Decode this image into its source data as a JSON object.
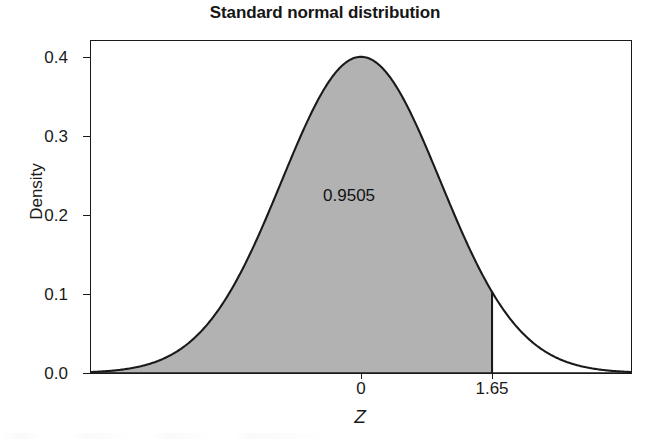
{
  "chart_data": {
    "type": "area",
    "title": "Standard normal distribution",
    "xlabel": "Z",
    "ylabel": "Density",
    "xlim": [
      -3.4,
      3.4
    ],
    "ylim": [
      0.0,
      0.42
    ],
    "grid": false,
    "legend": null,
    "curve": {
      "name": "standard normal density",
      "distribution": "normal",
      "mean": 0,
      "sd": 1,
      "peak_value": 0.4
    },
    "shaded_region": {
      "from": -3.4,
      "to": 1.65,
      "label": "0.9505",
      "probability": 0.9505,
      "fill_color": "#b2b2b2",
      "boundary_line_x": 1.65
    },
    "x_ticks": [
      {
        "value": 0,
        "label": "0"
      },
      {
        "value": 1.65,
        "label": "1.65"
      }
    ],
    "y_ticks": [
      {
        "value": 0.0,
        "label": "0.0"
      },
      {
        "value": 0.1,
        "label": "0.1"
      },
      {
        "value": 0.2,
        "label": "0.2"
      },
      {
        "value": 0.3,
        "label": "0.3"
      },
      {
        "value": 0.4,
        "label": "0.4"
      }
    ],
    "annotations": [
      {
        "text": "0.9505",
        "x": -0.15,
        "y": 0.225
      }
    ],
    "colors": {
      "axis": "#1a1a1a",
      "curve": "#1a1a1a",
      "fill": "#b2b2b2",
      "background": "#ffffff"
    }
  }
}
